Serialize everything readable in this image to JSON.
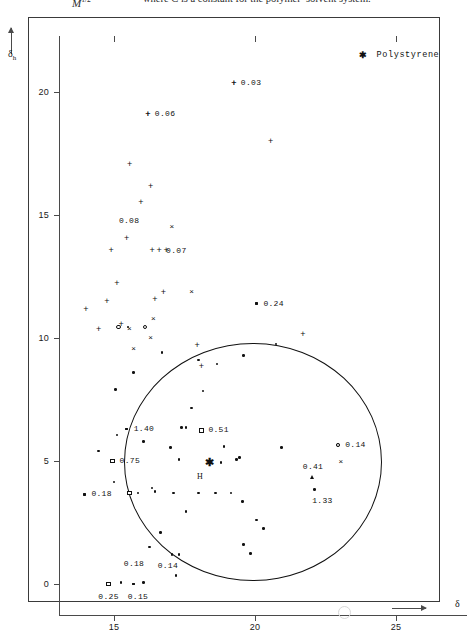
{
  "header": {
    "fraction_text": "M",
    "fraction_sup": "1/2",
    "sentence": "where C is a constant for the polymer–solvent system."
  },
  "legend": {
    "marker": "star",
    "marker_glyph": "✱",
    "label": "Polystyrene"
  },
  "axes": {
    "y_title": "δ",
    "y_subscript": "h",
    "x_title": "δ",
    "y_ticks": [
      0,
      5,
      10,
      15,
      20
    ],
    "x_ticks": [
      15,
      20,
      25
    ],
    "x_range": [
      13.1,
      27.6
    ],
    "y_range": [
      -1.4,
      22.4
    ]
  },
  "chart_data": {
    "type": "scatter",
    "xlabel": "δ",
    "ylabel": "δh",
    "xlim": [
      13.1,
      27.6
    ],
    "ylim": [
      -1.4,
      22.4
    ],
    "grid": false,
    "legend_position": "top-right",
    "legend": [
      {
        "name": "Polystyrene",
        "marker": "star"
      }
    ],
    "solubility_circle": {
      "center_x": 18.35,
      "center_y": 4.85,
      "radius_x": 4.55,
      "radius_y": 4.85,
      "stroke": "#111111"
    },
    "annotations": [
      {
        "label": "0.03",
        "x": 19.25,
        "y": 20.35,
        "marker": "plus"
      },
      {
        "label": "0.06",
        "x": 16.2,
        "y": 19.1,
        "marker": "plus"
      },
      {
        "label": "0.08",
        "x": 15.6,
        "y": 14.45,
        "marker": "none"
      },
      {
        "label": "0.07",
        "x": 16.6,
        "y": 13.55,
        "marker": "plus"
      },
      {
        "label": "0.24",
        "x": 20.05,
        "y": 11.4,
        "marker": "dot"
      },
      {
        "label": "1.40",
        "x": 15.45,
        "y": 6.3,
        "marker": "dot"
      },
      {
        "label": "0.51",
        "x": 18.1,
        "y": 6.25,
        "marker": "square"
      },
      {
        "label": "0.14",
        "x": 22.95,
        "y": 5.65,
        "marker": "circle"
      },
      {
        "label": "0.75",
        "x": 14.95,
        "y": 5.0,
        "marker": "square"
      },
      {
        "label": "0.41",
        "x": 22.05,
        "y": 4.75,
        "marker": "none"
      },
      {
        "label": "1.33",
        "x": 22.1,
        "y": 3.85,
        "marker": "dot"
      },
      {
        "label": "0.18",
        "x": 13.95,
        "y": 3.65,
        "marker": "dot"
      },
      {
        "label": "0.18",
        "x": 15.1,
        "y": 0.8,
        "marker": "none"
      },
      {
        "label": "0.14",
        "x": 16.3,
        "y": 0.75,
        "marker": "none"
      },
      {
        "label": "0.25",
        "x": 14.8,
        "y": 0.0,
        "marker": "square"
      },
      {
        "label": "0.15",
        "x": 15.7,
        "y": 0.0,
        "marker": "dot"
      },
      {
        "label": "H",
        "x": 18.05,
        "y": 4.35,
        "marker": "text"
      }
    ],
    "series": [
      {
        "name": "non-solvent (plus)",
        "marker": "plus",
        "points": [
          [
            19.25,
            20.35
          ],
          [
            16.2,
            19.1
          ],
          [
            20.55,
            18.0
          ],
          [
            15.55,
            17.05
          ],
          [
            16.3,
            16.15
          ],
          [
            15.95,
            15.5
          ],
          [
            15.45,
            14.05
          ],
          [
            14.9,
            13.55
          ],
          [
            16.35,
            13.55
          ],
          [
            16.85,
            13.55
          ],
          [
            15.1,
            12.2
          ],
          [
            14.75,
            11.5
          ],
          [
            16.45,
            11.55
          ],
          [
            16.75,
            11.85
          ],
          [
            14.0,
            11.15
          ],
          [
            14.45,
            10.35
          ],
          [
            15.25,
            10.55
          ],
          [
            21.7,
            10.15
          ],
          [
            17.95,
            9.7
          ],
          [
            18.1,
            8.85
          ]
        ]
      },
      {
        "name": "partial solvent (cross)",
        "marker": "cross",
        "points": [
          [
            17.05,
            14.5
          ],
          [
            17.75,
            11.85
          ],
          [
            16.3,
            10.0
          ],
          [
            15.55,
            10.35
          ],
          [
            16.4,
            10.75
          ],
          [
            23.05,
            4.95
          ],
          [
            15.7,
            9.55
          ]
        ]
      },
      {
        "name": "boundary (open circle)",
        "marker": "circle",
        "points": [
          [
            15.15,
            10.45
          ],
          [
            16.1,
            10.45
          ],
          [
            22.95,
            5.65
          ]
        ]
      },
      {
        "name": "boundary (open square)",
        "marker": "square",
        "points": [
          [
            18.1,
            6.25
          ],
          [
            14.95,
            5.0
          ],
          [
            15.55,
            3.7
          ],
          [
            14.8,
            0.0
          ]
        ]
      },
      {
        "name": "boundary (triangle)",
        "marker": "triangle",
        "points": [
          [
            22.05,
            4.35
          ]
        ]
      },
      {
        "name": "reference polymer (star)",
        "marker": "star",
        "points": [
          [
            18.35,
            4.95
          ]
        ]
      },
      {
        "name": "solvent (dot)",
        "marker": "dot",
        "points": [
          [
            15.5,
            10.45
          ],
          [
            20.05,
            11.4
          ],
          [
            16.7,
            9.4
          ],
          [
            19.6,
            9.3
          ],
          [
            18.0,
            9.1
          ],
          [
            15.7,
            8.6
          ],
          [
            15.05,
            7.9
          ],
          [
            17.75,
            7.15
          ],
          [
            15.45,
            6.3
          ],
          [
            15.1,
            6.05
          ],
          [
            17.4,
            6.35
          ],
          [
            17.55,
            6.35
          ],
          [
            16.05,
            5.8
          ],
          [
            17.0,
            5.55
          ],
          [
            18.9,
            5.6
          ],
          [
            20.95,
            5.55
          ],
          [
            17.3,
            5.05
          ],
          [
            18.8,
            4.95
          ],
          [
            19.35,
            5.05
          ],
          [
            19.45,
            5.15
          ],
          [
            14.45,
            5.4
          ],
          [
            15.0,
            4.15
          ],
          [
            16.35,
            3.9
          ],
          [
            15.85,
            3.7
          ],
          [
            16.45,
            3.75
          ],
          [
            17.1,
            3.7
          ],
          [
            18.0,
            3.7
          ],
          [
            18.6,
            3.7
          ],
          [
            19.15,
            3.7
          ],
          [
            19.55,
            3.35
          ],
          [
            13.95,
            3.65
          ],
          [
            17.55,
            2.95
          ],
          [
            20.05,
            2.6
          ],
          [
            20.3,
            2.25
          ],
          [
            16.65,
            2.1
          ],
          [
            16.25,
            1.5
          ],
          [
            19.6,
            1.6
          ],
          [
            19.85,
            1.25
          ],
          [
            17.05,
            1.2
          ],
          [
            17.3,
            1.2
          ],
          [
            15.25,
            0.05
          ],
          [
            15.7,
            0.0
          ],
          [
            16.05,
            0.05
          ],
          [
            18.15,
            7.85
          ],
          [
            18.65,
            8.95
          ],
          [
            20.75,
            9.75
          ],
          [
            17.2,
            0.35
          ]
        ]
      }
    ]
  }
}
